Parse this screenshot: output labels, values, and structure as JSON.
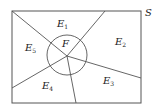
{
  "diagram": {
    "type": "set-partition",
    "universe_label": "S",
    "circle_label": "F",
    "regions": [
      {
        "id": "E1",
        "base": "E",
        "sub": "1"
      },
      {
        "id": "E2",
        "base": "E",
        "sub": "2"
      },
      {
        "id": "E3",
        "base": "E",
        "sub": "3"
      },
      {
        "id": "E4",
        "base": "E",
        "sub": "4"
      },
      {
        "id": "E5",
        "base": "E",
        "sub": "5"
      }
    ],
    "colors": {
      "stroke": "#555555",
      "text": "#222222",
      "background": "#ffffff"
    }
  }
}
